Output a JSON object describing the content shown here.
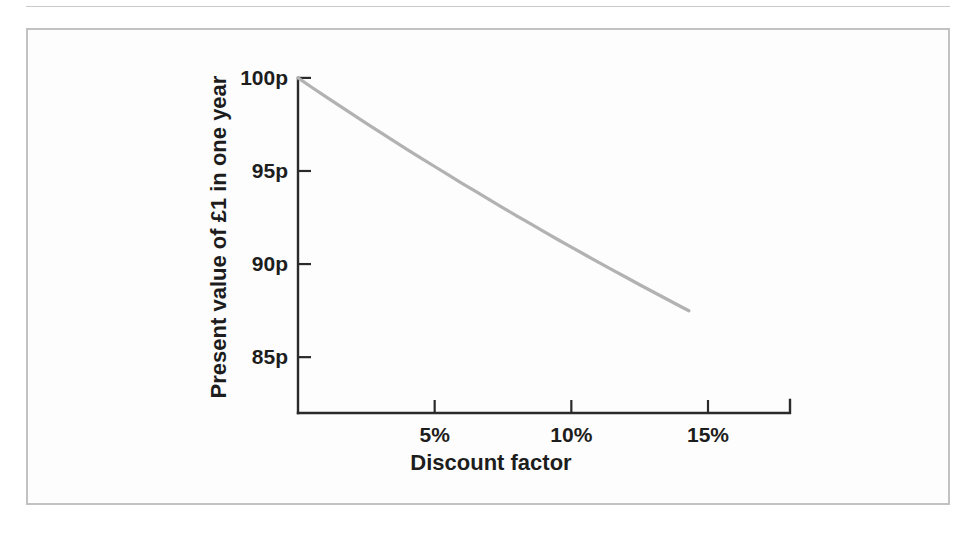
{
  "figure": {
    "frame_color": "#c2c2c2",
    "background_color": "#fdfdfd",
    "page_color": "#ffffff"
  },
  "ghost_text": {
    "note": "faint show-through text from the opposite side of the scanned page; illegible",
    "lines": [
      "",
      "",
      "",
      "",
      "",
      "",
      "",
      ""
    ]
  },
  "chart_data": {
    "type": "line",
    "title": "",
    "subtitle": "",
    "xlabel": "Discount factor",
    "ylabel": "Present value of £1 in one year",
    "xlim": [
      0,
      18
    ],
    "ylim": [
      82,
      100.8
    ],
    "grid": false,
    "legend": null,
    "legend_position": "none",
    "line_color": "#b2b2b2",
    "axis_color": "#2a2a2a",
    "xticks": [
      5,
      10,
      15
    ],
    "xtick_labels": [
      "5%",
      "10%",
      "15%"
    ],
    "yticks": [
      85,
      90,
      95,
      100
    ],
    "ytick_labels": [
      "85p",
      "90p",
      "95p",
      "100p"
    ],
    "series": [
      {
        "name": "Present value of £1 in one year",
        "formula": "100 / (1 + r)",
        "x": [
          0,
          0.5,
          1,
          1.5,
          2,
          2.5,
          3,
          3.5,
          4,
          4.5,
          5,
          5.5,
          6,
          6.5,
          7,
          7.5,
          8,
          8.5,
          9,
          9.5,
          10,
          10.5,
          11,
          11.5,
          12,
          12.5,
          13,
          13.5,
          14,
          14.3
        ],
        "values": [
          100,
          99.5,
          99.01,
          98.52,
          98.04,
          97.56,
          97.09,
          96.62,
          96.15,
          95.69,
          95.24,
          94.79,
          94.34,
          93.9,
          93.46,
          93.02,
          92.59,
          92.17,
          91.74,
          91.32,
          90.91,
          90.5,
          90.09,
          89.69,
          89.29,
          88.89,
          88.5,
          88.11,
          87.72,
          87.49
        ]
      }
    ]
  }
}
